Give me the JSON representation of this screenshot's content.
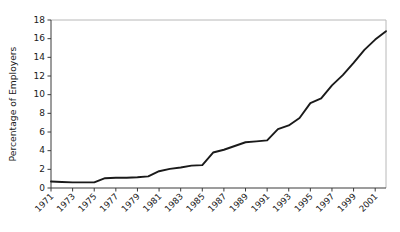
{
  "chart_data": {
    "type": "line",
    "title": "",
    "xlabel": "",
    "ylabel": "Percentage of Employers",
    "xlim": [
      1971,
      2002
    ],
    "ylim": [
      0,
      18
    ],
    "ytick_step": 2,
    "grid": false,
    "legend": null,
    "yticks": [
      0,
      2,
      4,
      6,
      8,
      10,
      12,
      14,
      16,
      18
    ],
    "ytick_labels": [
      "0",
      "2",
      "4",
      "6",
      "8",
      "10",
      "12",
      "14",
      "16",
      "18"
    ],
    "xticks": [
      1971,
      1973,
      1975,
      1977,
      1979,
      1981,
      1983,
      1985,
      1987,
      1989,
      1991,
      1993,
      1995,
      1997,
      1999,
      2001
    ],
    "xtick_labels": [
      "1971",
      "1973",
      "1975",
      "1977",
      "1979",
      "1981",
      "1983",
      "1985",
      "1987",
      "1989",
      "1991",
      "1993",
      "1995",
      "1997",
      "1999",
      "2001"
    ],
    "xtick_rotation": 45,
    "line_color": "#1a1a1a",
    "x": [
      1971,
      1972,
      1973,
      1974,
      1975,
      1976,
      1977,
      1978,
      1979,
      1980,
      1981,
      1982,
      1983,
      1984,
      1985,
      1986,
      1987,
      1988,
      1989,
      1990,
      1991,
      1992,
      1993,
      1994,
      1995,
      1996,
      1997,
      1998,
      1999,
      2000,
      2001,
      2002
    ],
    "values": [
      0.7,
      0.65,
      0.6,
      0.6,
      0.6,
      1.05,
      1.1,
      1.1,
      1.15,
      1.25,
      1.8,
      2.05,
      2.2,
      2.4,
      2.45,
      3.8,
      4.1,
      4.5,
      4.9,
      5.0,
      5.1,
      6.3,
      6.7,
      7.5,
      9.1,
      9.6,
      11.0,
      12.1,
      13.4,
      14.8,
      15.9,
      16.8
    ],
    "series_name": "Percentage of Employers"
  },
  "axis": {
    "y_title": "Percentage of Employers"
  }
}
